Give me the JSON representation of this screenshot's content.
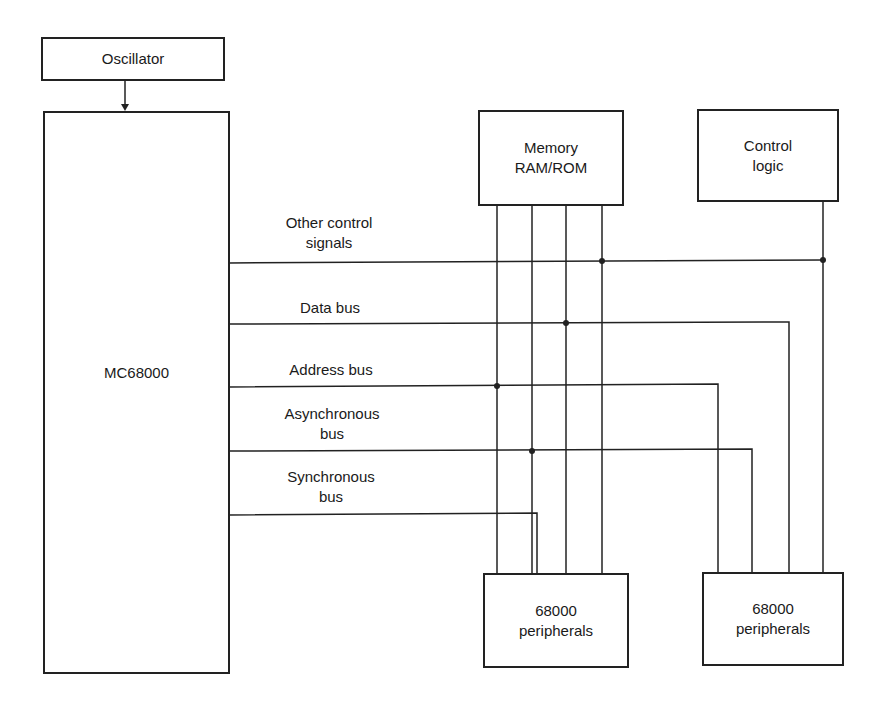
{
  "blocks": {
    "oscillator": {
      "label": "Oscillator"
    },
    "cpu": {
      "label": "MC68000"
    },
    "memory": {
      "line1": "Memory",
      "line2": "RAM/ROM"
    },
    "control_logic": {
      "line1": "Control",
      "line2": "logic"
    },
    "peripherals_1": {
      "line1": "68000",
      "line2": "peripherals"
    },
    "peripherals_2": {
      "line1": "68000",
      "line2": "peripherals"
    }
  },
  "buses": [
    {
      "line1": "Other control",
      "line2": "signals"
    },
    {
      "line1": "Data bus",
      "line2": ""
    },
    {
      "line1": "Address bus",
      "line2": ""
    },
    {
      "line1": "Asynchronous",
      "line2": "bus"
    },
    {
      "line1": "Synchronous",
      "line2": "bus"
    }
  ],
  "colors": {
    "line": "#222222",
    "background": "#ffffff"
  }
}
